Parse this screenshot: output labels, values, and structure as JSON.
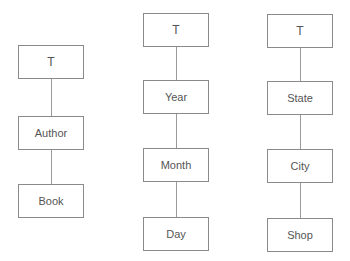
{
  "diagram": {
    "type": "hierarchy-trees",
    "trees": [
      {
        "name": "book-hierarchy",
        "nodes": [
          "T",
          "Author",
          "Book"
        ]
      },
      {
        "name": "time-hierarchy",
        "nodes": [
          "T",
          "Year",
          "Month",
          "Day"
        ]
      },
      {
        "name": "location-hierarchy",
        "nodes": [
          "T",
          "State",
          "City",
          "Shop"
        ]
      }
    ]
  }
}
